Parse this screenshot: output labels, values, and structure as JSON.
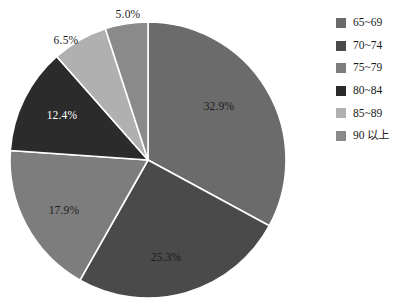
{
  "chart_data": {
    "type": "pie",
    "title": "",
    "categories": [
      "65~69",
      "70~74",
      "75~79",
      "80~84",
      "85~89",
      "90 以上"
    ],
    "values": [
      32.9,
      25.3,
      17.9,
      12.4,
      6.5,
      5.0
    ],
    "value_labels": [
      "32.9%",
      "25.3%",
      "17.9%",
      "12.4%",
      "6.5%",
      "5.0%"
    ],
    "colors": [
      "#6b6b6b",
      "#4a4a4a",
      "#7d7d7d",
      "#2b2b2b",
      "#b0b0b0",
      "#8a8a8a"
    ],
    "unit": "%",
    "start_angle_deg": 0,
    "direction": "clockwise",
    "legend_position": "right",
    "grid": false,
    "xlabel": "",
    "ylabel": ""
  },
  "legend": {
    "items": [
      {
        "label": "65~69",
        "color": "#6b6b6b"
      },
      {
        "label": "70~74",
        "color": "#4a4a4a"
      },
      {
        "label": "75~79",
        "color": "#7d7d7d"
      },
      {
        "label": "80~84",
        "color": "#2b2b2b"
      },
      {
        "label": "85~89",
        "color": "#b0b0b0"
      },
      {
        "label": "90 以上",
        "color": "#8a8a8a"
      }
    ]
  },
  "slice_labels": [
    {
      "text": "32.9%",
      "x": 219,
      "y": 107,
      "tone": "inside-light"
    },
    {
      "text": "25.3%",
      "x": 166,
      "y": 258,
      "tone": "inside-light"
    },
    {
      "text": "17.9%",
      "x": 64,
      "y": 211,
      "tone": "inside-light"
    },
    {
      "text": "12.4%",
      "x": 62,
      "y": 116,
      "tone": "inside-dark"
    },
    {
      "text": "6.5%",
      "x": 66,
      "y": 41,
      "tone": "outside"
    },
    {
      "text": "5.0%",
      "x": 128,
      "y": 15,
      "tone": "outside"
    }
  ]
}
